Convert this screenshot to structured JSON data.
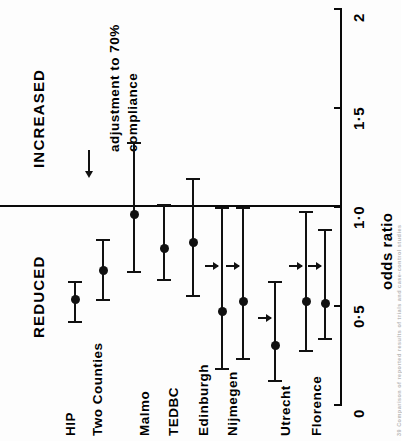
{
  "figure": {
    "axis_title": "odds ratio",
    "direction_labels": {
      "increased": "INCREASED",
      "reduced": "REDUCED"
    },
    "annotation_line1": "adjustment to 70%",
    "annotation_line2": "compliance",
    "annotation_arrow": "down-arrow-icon",
    "caption": "39  Comparison of reported results of trials and case-control studies",
    "colors": {
      "ink": "#111111",
      "paper": "#fdfdfd"
    }
  },
  "chart_data": {
    "type": "scatter",
    "orientation": "rotated-90-forest-plot",
    "title": "",
    "xlabel": "",
    "ylabel": "odds ratio",
    "ylim": [
      0,
      2
    ],
    "yticks": [
      0,
      0.5,
      1.0,
      1.5,
      2
    ],
    "ytick_labels": [
      "0",
      "0·5",
      "1·0",
      "1·5",
      "2"
    ],
    "reference_line": 1.0,
    "grid": false,
    "legend": "none",
    "categories": [
      "HIP",
      "Two Counties",
      "Malmo",
      "TEDBC",
      "Edinburgh",
      "Nijmegen",
      "Nijmegen",
      "Utrecht",
      "Florence",
      "Florence"
    ],
    "points": [
      {
        "study": "HIP",
        "x_px": 75,
        "odds_ratio": 0.53,
        "ci_low": 0.42,
        "ci_high": 0.62,
        "adjusted_arrow": false
      },
      {
        "study": "Two Counties",
        "x_px": 103,
        "odds_ratio": 0.68,
        "ci_low": 0.53,
        "ci_high": 0.83,
        "adjusted_arrow": false
      },
      {
        "study": "Malmo",
        "x_px": 134,
        "odds_ratio": 0.96,
        "ci_low": 0.67,
        "ci_high": 1.32,
        "adjusted_arrow": false
      },
      {
        "study": "TEDBC",
        "x_px": 164,
        "odds_ratio": 0.79,
        "ci_low": 0.63,
        "ci_high": 1.01,
        "adjusted_arrow": false
      },
      {
        "study": "Edinburgh",
        "x_px": 193,
        "odds_ratio": 0.82,
        "ci_low": 0.55,
        "ci_high": 1.14,
        "adjusted_arrow": false
      },
      {
        "study": "Nijmegen",
        "x_px": 222,
        "odds_ratio": 0.47,
        "ci_low": 0.18,
        "ci_high": 0.99,
        "adjusted_arrow": true,
        "arrow_at": 0.7
      },
      {
        "study": "Nijmegen",
        "x_px": 243,
        "odds_ratio": 0.52,
        "ci_low": 0.23,
        "ci_high": 0.99,
        "adjusted_arrow": true,
        "arrow_at": 0.7
      },
      {
        "study": "Utrecht",
        "x_px": 275,
        "odds_ratio": 0.3,
        "ci_low": 0.12,
        "ci_high": 0.62,
        "adjusted_arrow": true,
        "arrow_at": 0.44
      },
      {
        "study": "Florence",
        "x_px": 306,
        "odds_ratio": 0.52,
        "ci_low": 0.27,
        "ci_high": 0.97,
        "adjusted_arrow": true,
        "arrow_at": 0.7
      },
      {
        "study": "Florence",
        "x_px": 325,
        "odds_ratio": 0.51,
        "ci_low": 0.33,
        "ci_high": 0.88,
        "adjusted_arrow": true,
        "arrow_at": 0.7
      }
    ],
    "study_labels": [
      {
        "label": "HIP",
        "x_px": 63
      },
      {
        "label": "Two Counties",
        "x_px": 90
      },
      {
        "label": "Malmo",
        "x_px": 137
      },
      {
        "label": "TEDBC",
        "x_px": 166
      },
      {
        "label": "Edinburgh",
        "x_px": 196
      },
      {
        "label": "Nijmegen",
        "x_px": 225
      },
      {
        "label": "Utrecht",
        "x_px": 278
      },
      {
        "label": "Florence",
        "x_px": 309
      }
    ]
  }
}
